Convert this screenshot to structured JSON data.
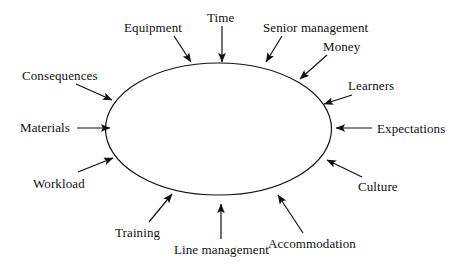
{
  "diagram": {
    "type": "central-ellipse-with-inward-arrows",
    "background_color": "#ffffff",
    "stroke_color": "#111111",
    "text_color": "#111111",
    "shape": {
      "name": "central-ellipse",
      "cx": 218.5,
      "cy": 129,
      "rx": 113,
      "ry": 66,
      "fill": "none",
      "stroke_width": 1.2
    },
    "labels": [
      {
        "id": "equipment",
        "text": "Equipment",
        "x": 124,
        "y": 21,
        "arrow": {
          "x1": 174,
          "y1": 36,
          "x2": 191,
          "y2": 62
        }
      },
      {
        "id": "time",
        "text": "Time",
        "x": 207,
        "y": 11,
        "arrow": {
          "x1": 222,
          "y1": 26,
          "x2": 222,
          "y2": 62
        }
      },
      {
        "id": "senior-management",
        "text": "Senior management",
        "x": 263,
        "y": 21,
        "arrow": {
          "x1": 282,
          "y1": 36,
          "x2": 266,
          "y2": 62
        }
      },
      {
        "id": "money",
        "text": "Money",
        "x": 323,
        "y": 40,
        "arrow": {
          "x1": 327,
          "y1": 55,
          "x2": 300,
          "y2": 79
        }
      },
      {
        "id": "learners",
        "text": "Learners",
        "x": 348,
        "y": 79,
        "arrow": {
          "x1": 352,
          "y1": 95,
          "x2": 324,
          "y2": 104
        }
      },
      {
        "id": "expectations",
        "text": "Expectations",
        "x": 377,
        "y": 122,
        "arrow": {
          "x1": 372,
          "y1": 128,
          "x2": 336,
          "y2": 128
        }
      },
      {
        "id": "culture",
        "text": "Culture",
        "x": 358,
        "y": 180,
        "arrow": {
          "x1": 362,
          "y1": 177,
          "x2": 327,
          "y2": 160
        }
      },
      {
        "id": "accommodation",
        "text": "Accommodation",
        "x": 268,
        "y": 237,
        "arrow": {
          "x1": 303,
          "y1": 233,
          "x2": 278,
          "y2": 195
        }
      },
      {
        "id": "line-management",
        "text": "Line management",
        "x": 174,
        "y": 243,
        "arrow": {
          "x1": 221,
          "y1": 239,
          "x2": 221,
          "y2": 204
        }
      },
      {
        "id": "training",
        "text": "Training",
        "x": 115,
        "y": 226,
        "arrow": {
          "x1": 149,
          "y1": 222,
          "x2": 172,
          "y2": 194
        }
      },
      {
        "id": "workload",
        "text": "Workload",
        "x": 33,
        "y": 177,
        "arrow": {
          "x1": 78,
          "y1": 172,
          "x2": 113,
          "y2": 158
        }
      },
      {
        "id": "materials",
        "text": "Materials",
        "x": 20,
        "y": 121,
        "arrow": {
          "x1": 77,
          "y1": 128,
          "x2": 110,
          "y2": 128
        }
      },
      {
        "id": "consequences",
        "text": "Consequences",
        "x": 22,
        "y": 69,
        "arrow": {
          "x1": 76,
          "y1": 84,
          "x2": 112,
          "y2": 100
        }
      }
    ]
  }
}
